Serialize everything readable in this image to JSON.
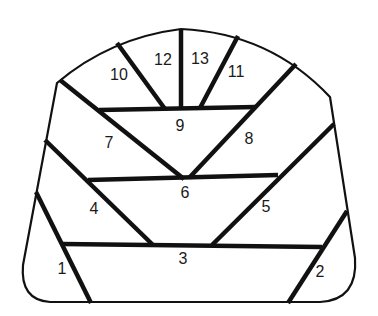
{
  "diagram": {
    "stroke_color": "#111111",
    "background_color": "#ffffff",
    "regions": [
      {
        "id": "1",
        "label": "1",
        "x": 62,
        "y": 269
      },
      {
        "id": "2",
        "label": "2",
        "x": 320,
        "y": 272
      },
      {
        "id": "3",
        "label": "3",
        "x": 183,
        "y": 259
      },
      {
        "id": "4",
        "label": "4",
        "x": 94,
        "y": 209
      },
      {
        "id": "5",
        "label": "5",
        "x": 266,
        "y": 207
      },
      {
        "id": "6",
        "label": "6",
        "x": 185,
        "y": 193
      },
      {
        "id": "7",
        "label": "7",
        "x": 109,
        "y": 143
      },
      {
        "id": "8",
        "label": "8",
        "x": 249,
        "y": 139
      },
      {
        "id": "9",
        "label": "9",
        "x": 180,
        "y": 126
      },
      {
        "id": "10",
        "label": "10",
        "x": 119,
        "y": 75
      },
      {
        "id": "11",
        "label": "11",
        "x": 236,
        "y": 72
      },
      {
        "id": "12",
        "label": "12",
        "x": 163,
        "y": 60
      },
      {
        "id": "13",
        "label": "13",
        "x": 200,
        "y": 59
      }
    ]
  }
}
